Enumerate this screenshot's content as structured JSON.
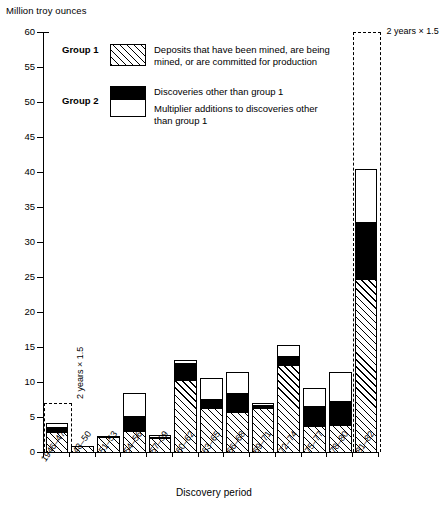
{
  "chart_data": {
    "type": "bar",
    "title": "",
    "ylabel": "Million troy ounces",
    "xlabel": "Discovery period",
    "ylim": [
      0,
      60
    ],
    "ytick_step": 5,
    "yticks": [
      0,
      5,
      10,
      15,
      20,
      25,
      30,
      35,
      40,
      45,
      50,
      55,
      60
    ],
    "grid": false,
    "legend_position": "upper-left-inside",
    "stacked": true,
    "categories": [
      "1946–47",
      "48–50",
      "51–53",
      "54–56",
      "57–59",
      "60–62",
      "63–65",
      "66–68",
      "69–71",
      "72–74",
      "75–77",
      "78–80",
      "81–82"
    ],
    "series": [
      {
        "name": "Deposits that have been mined, are being mined, or are committed for production",
        "group": "Group 1",
        "fill": "hatched",
        "values": [
          3.0,
          1.0,
          2.3,
          3.2,
          2.2,
          10.5,
          6.4,
          5.9,
          6.5,
          12.6,
          3.8,
          4.0,
          24.8
        ]
      },
      {
        "name": "Discoveries other than group 1",
        "group": "Group 2",
        "fill": "black",
        "values": [
          0.8,
          0.0,
          0.3,
          2.2,
          0.2,
          2.5,
          1.5,
          2.8,
          0.5,
          1.4,
          3.0,
          3.6,
          8.4
        ]
      },
      {
        "name": "Multiplier additions to discoveries other than group 1",
        "group": "Group 2",
        "fill": "white",
        "values": [
          0.8,
          0.0,
          0.0,
          3.4,
          0.4,
          0.6,
          3.1,
          3.2,
          0.4,
          1.7,
          2.8,
          4.2,
          7.6
        ]
      }
    ],
    "totals": [
      4.6,
      1.0,
      2.6,
      8.8,
      2.8,
      13.6,
      11.0,
      11.9,
      7.4,
      15.7,
      9.6,
      11.8,
      40.8
    ],
    "annotations": [
      {
        "id": "ann-first",
        "text": "2 years  ×  1.5",
        "value": 7.0,
        "category": "1946–47",
        "orientation": "vertical"
      },
      {
        "id": "ann-last",
        "text": "2 years  ×  1.5",
        "value": 60.0,
        "category": "81–82",
        "orientation": "horizontal"
      }
    ]
  },
  "legend": {
    "group1_label": "Group 1",
    "group2_label": "Group 2",
    "entries": [
      {
        "swatch": "hatched",
        "line1": "Deposits that have been mined, are being",
        "line2": "mined, or are committed for production"
      },
      {
        "swatch": "black",
        "line1": "Discoveries other than group 1",
        "line2": ""
      },
      {
        "swatch": "white",
        "line1": "Multiplier additions to discoveries other",
        "line2": "than group 1"
      }
    ]
  },
  "axes": {
    "y_title": "Million troy ounces",
    "x_title": "Discovery period",
    "y_tick_labels": [
      "0",
      "5",
      "10",
      "15",
      "20",
      "25",
      "30",
      "35",
      "40",
      "45",
      "50",
      "55",
      "60"
    ],
    "x_tick_labels": [
      "1946–47",
      "48–50",
      "51–53",
      "54–56",
      "57–59",
      "60–62",
      "63–65",
      "66–68",
      "69–71",
      "72–74",
      "75–77",
      "78–80",
      "81–82"
    ]
  },
  "colors": {
    "ink": "#000000",
    "paper": "#ffffff",
    "group2_black": "#000000",
    "group2_white": "#ffffff"
  }
}
